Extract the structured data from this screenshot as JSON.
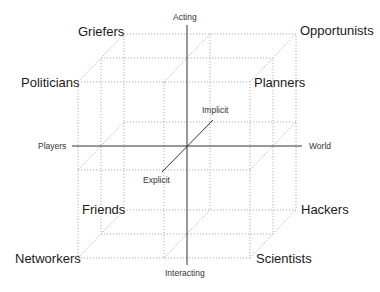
{
  "diagram": {
    "type": "3d-cube-taxonomy",
    "colors": {
      "grid": "#9a9a9a",
      "axis": "#333333",
      "text": "#1a1a1a"
    },
    "axes": {
      "vertical_top": "Acting",
      "vertical_bottom": "Interacting",
      "horizontal_left": "Players",
      "horizontal_right": "World",
      "depth_back": "Implicit",
      "depth_front": "Explicit"
    },
    "corners": {
      "back_top_left": "Griefers",
      "back_top_right": "Opportunists",
      "front_top_left": "Politicians",
      "front_top_right": "Planners",
      "back_bottom_left": "Friends",
      "back_bottom_right": "Hackers",
      "front_bottom_left": "Networkers",
      "front_bottom_right": "Scientists"
    }
  }
}
